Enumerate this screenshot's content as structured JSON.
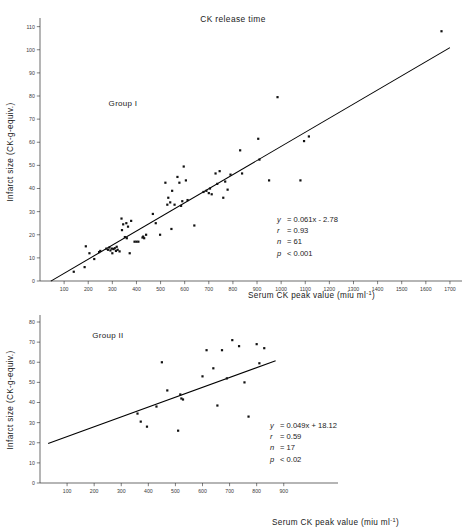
{
  "corner_note": "",
  "axes_labels": {
    "y": "Infarct size (CK-g-equiv.)",
    "x": "Serum CK peak value (miu ml",
    "x_sup": "-1",
    "x_close": ")"
  },
  "panels": [
    {
      "id": "group-1",
      "title": "CK release time",
      "group_label": "Group I",
      "stats": {
        "equation_lhs": "y",
        "equation_rhs": "= 0.061x - 2.78",
        "r_lhs": "r",
        "r_rhs": "= 0.93",
        "n_lhs": "n",
        "n_rhs": "= 61",
        "p_lhs": "p",
        "p_rhs": "< 0.001"
      }
    },
    {
      "id": "group-2",
      "title": "",
      "group_label": "Group II",
      "stats": {
        "equation_lhs": "y",
        "equation_rhs": "= 0.049x + 18.12",
        "r_lhs": "r",
        "r_rhs": "= 0.59",
        "n_lhs": "n",
        "n_rhs": "= 17",
        "p_lhs": "p",
        "p_rhs": "< 0.02"
      }
    }
  ],
  "chart_data": [
    {
      "type": "scatter",
      "title": "CK release time",
      "annotation": "Group I",
      "xlabel": "Serum CK peak value (miu ml-1)",
      "ylabel": "Infarct size (CK-g-equiv.)",
      "xlim": [
        0,
        1750
      ],
      "ylim": [
        0,
        112
      ],
      "xticks": [
        100,
        200,
        300,
        400,
        500,
        600,
        700,
        800,
        900,
        1000,
        1100,
        1200,
        1300,
        1400,
        1500,
        1600,
        1700
      ],
      "yticks": [
        0,
        10,
        20,
        30,
        40,
        50,
        60,
        70,
        80,
        90,
        100,
        110
      ],
      "grid": false,
      "legend": "none",
      "regression": {
        "slope": 0.061,
        "intercept": -2.78,
        "equation": "y = 0.061x - 2.78",
        "r": 0.93,
        "n": 61,
        "p": "< 0.001",
        "x_start": 45,
        "x_end": 1700
      },
      "points": [
        [
          140,
          4
        ],
        [
          185,
          6
        ],
        [
          190,
          15
        ],
        [
          205,
          12
        ],
        [
          225,
          9.5
        ],
        [
          245,
          12.5
        ],
        [
          250,
          13
        ],
        [
          275,
          14
        ],
        [
          282,
          13.5
        ],
        [
          288,
          14.5
        ],
        [
          292,
          13.2
        ],
        [
          298,
          14
        ],
        [
          300,
          12
        ],
        [
          305,
          13.8
        ],
        [
          310,
          14.2
        ],
        [
          315,
          13
        ],
        [
          318,
          14.8
        ],
        [
          322,
          13.5
        ],
        [
          330,
          12.8
        ],
        [
          338,
          27
        ],
        [
          340,
          22
        ],
        [
          345,
          24.5
        ],
        [
          352,
          19
        ],
        [
          358,
          25
        ],
        [
          360,
          18.5
        ],
        [
          365,
          23.5
        ],
        [
          372,
          12
        ],
        [
          378,
          26
        ],
        [
          392,
          17
        ],
        [
          400,
          17
        ],
        [
          408,
          17
        ],
        [
          425,
          18.8
        ],
        [
          428,
          19.2
        ],
        [
          432,
          18.5
        ],
        [
          440,
          20
        ],
        [
          468,
          29
        ],
        [
          480,
          25
        ],
        [
          498,
          20
        ],
        [
          520,
          42.5
        ],
        [
          528,
          33
        ],
        [
          532,
          36
        ],
        [
          540,
          34
        ],
        [
          545,
          22.5
        ],
        [
          548,
          39
        ],
        [
          558,
          33
        ],
        [
          570,
          45
        ],
        [
          578,
          42.5
        ],
        [
          585,
          32.5
        ],
        [
          590,
          34.5
        ],
        [
          596,
          49.5
        ],
        [
          605,
          43.5
        ],
        [
          612,
          35
        ],
        [
          640,
          24
        ],
        [
          678,
          38.5
        ],
        [
          690,
          39
        ],
        [
          700,
          38
        ],
        [
          705,
          40
        ],
        [
          712,
          37.5
        ],
        [
          728,
          46.5
        ],
        [
          735,
          42
        ],
        [
          745,
          47.5
        ],
        [
          760,
          36
        ],
        [
          768,
          43
        ],
        [
          778,
          39.5
        ],
        [
          790,
          46
        ],
        [
          830,
          56.5
        ],
        [
          838,
          46.5
        ],
        [
          905,
          61.5
        ],
        [
          910,
          52.5
        ],
        [
          950,
          43.5
        ],
        [
          985,
          79.5
        ],
        [
          1080,
          43.5
        ],
        [
          1095,
          60.5
        ],
        [
          1115,
          62.5
        ],
        [
          1665,
          108
        ]
      ]
    },
    {
      "type": "scatter",
      "title": "",
      "annotation": "Group II",
      "xlabel": "Serum CK peak value (miu ml-1)",
      "ylabel": "Infarct size (CK-g-equiv.)",
      "xlim": [
        0,
        960
      ],
      "ylim": [
        0,
        82
      ],
      "xticks": [
        100,
        200,
        300,
        400,
        500,
        600,
        700,
        800,
        900
      ],
      "yticks": [
        0,
        10,
        20,
        30,
        40,
        50,
        60,
        70,
        80
      ],
      "grid": false,
      "legend": "none",
      "regression": {
        "slope": 0.049,
        "intercept": 18.12,
        "equation": "y = 0.049x + 18.12",
        "r": 0.59,
        "n": 17,
        "p": "< 0.02",
        "x_start": 30,
        "x_end": 870
      },
      "points": [
        [
          360,
          34.5
        ],
        [
          372,
          30.5
        ],
        [
          395,
          28
        ],
        [
          430,
          38
        ],
        [
          450,
          60
        ],
        [
          470,
          46
        ],
        [
          510,
          26
        ],
        [
          518,
          44
        ],
        [
          522,
          42
        ],
        [
          528,
          41.5
        ],
        [
          600,
          53
        ],
        [
          615,
          66
        ],
        [
          640,
          57
        ],
        [
          655,
          38.5
        ],
        [
          672,
          66
        ],
        [
          690,
          52
        ],
        [
          710,
          71
        ],
        [
          735,
          68
        ],
        [
          755,
          50
        ],
        [
          770,
          33
        ],
        [
          800,
          69
        ],
        [
          810,
          59.5
        ],
        [
          828,
          67
        ]
      ]
    }
  ]
}
